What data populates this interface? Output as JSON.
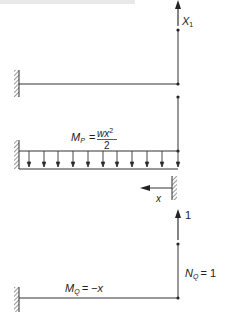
{
  "header_text_partial": "…",
  "diagram1": {
    "force_label": "X",
    "force_label_sub": "1"
  },
  "diagram2": {
    "moment_label": "M",
    "moment_sub": "P",
    "equals": "=",
    "numerator": "wx",
    "numerator_sup": "2",
    "denominator": "2",
    "coord_label": "x"
  },
  "diagram3": {
    "unit_force_label": "1",
    "moment_label": "M",
    "moment_sub": "Q",
    "moment_rhs": "= −x",
    "axial_label": "N",
    "axial_sub": "Q",
    "axial_rhs": "= 1"
  },
  "colors": {
    "line": "#333333",
    "hatch": "#555555"
  }
}
